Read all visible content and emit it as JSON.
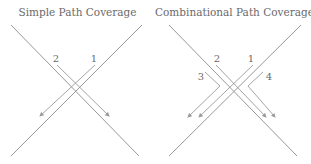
{
  "panels": [
    {
      "title": "Simple Path Coverage",
      "paths": [
        {
          "label": "1",
          "type": "straight"
        },
        {
          "label": "2",
          "type": "straight"
        }
      ]
    },
    {
      "title": "Combinational Path Coverage",
      "paths": [
        {
          "label": "1",
          "type": "straight"
        },
        {
          "label": "2",
          "type": "straight"
        },
        {
          "label": "3",
          "type": "turn"
        },
        {
          "label": "4",
          "type": "turn"
        }
      ]
    }
  ],
  "colors": {
    "road": "#8c8c8c",
    "path": "#9a9a9a",
    "text": "#6a6a6a"
  }
}
